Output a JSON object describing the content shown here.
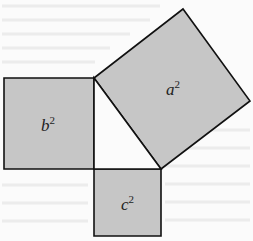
{
  "figure": {
    "fill_color": "#c6c6c6",
    "stroke_color": "#111111",
    "background_color": "#fbfbfb",
    "triangle": {
      "vertices": [
        [
          94,
          78
        ],
        [
          94,
          169
        ],
        [
          161,
          169
        ]
      ]
    },
    "squares": [
      {
        "id": "a",
        "label_base": "a",
        "label_exp": "2",
        "points": [
          [
            94,
            78
          ],
          [
            183,
            9
          ],
          [
            250,
            101
          ],
          [
            161,
            169
          ]
        ],
        "label_pos": [
          166,
          95
        ]
      },
      {
        "id": "b",
        "label_base": "b",
        "label_exp": "2",
        "points": [
          [
            4,
            78
          ],
          [
            94,
            78
          ],
          [
            94,
            169
          ],
          [
            4,
            169
          ]
        ],
        "label_pos": [
          41,
          131
        ]
      },
      {
        "id": "c",
        "label_base": "c",
        "label_exp": "2",
        "points": [
          [
            94,
            169
          ],
          [
            161,
            169
          ],
          [
            161,
            236
          ],
          [
            94,
            236
          ]
        ],
        "label_pos": [
          121,
          210
        ]
      }
    ]
  }
}
